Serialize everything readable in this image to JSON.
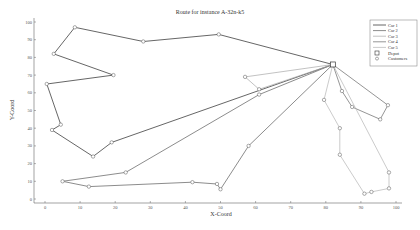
{
  "chart_data": {
    "type": "line",
    "title": "Route for instance A-32n-k5",
    "xlabel": "X-Coord",
    "ylabel": "Y-Coord",
    "xlim": [
      -3,
      102
    ],
    "ylim": [
      -3,
      102
    ],
    "xticks": [
      0,
      10,
      20,
      30,
      40,
      50,
      60,
      70,
      80,
      90,
      100
    ],
    "yticks": [
      0,
      10,
      20,
      30,
      40,
      50,
      60,
      70,
      80,
      90,
      100
    ],
    "grid": false,
    "legend_position": "upper right",
    "depot": {
      "x": 82,
      "y": 76
    },
    "series": [
      {
        "name": "Car 1",
        "color": "#555555",
        "width": 0.9,
        "points": [
          [
            82,
            76
          ],
          [
            49.5,
            93
          ],
          [
            28,
            89
          ],
          [
            8.5,
            97
          ],
          [
            2.5,
            82
          ],
          [
            19.5,
            70
          ],
          [
            0.5,
            65
          ],
          [
            4.5,
            42
          ],
          [
            2,
            39
          ],
          [
            13.7,
            24
          ],
          [
            19,
            32
          ],
          [
            82,
            76
          ]
        ]
      },
      {
        "name": "Car 2",
        "color": "#6e6e6e",
        "width": 0.8,
        "points": [
          [
            82,
            76
          ],
          [
            61,
            59
          ],
          [
            23,
            15
          ],
          [
            5,
            10
          ],
          [
            12.5,
            7
          ],
          [
            42,
            9.5
          ],
          [
            49,
            8.5
          ],
          [
            50,
            5.5
          ],
          [
            58,
            30
          ],
          [
            82,
            76
          ]
        ]
      },
      {
        "name": "Car 3",
        "color": "#a8a8a8",
        "width": 0.7,
        "points": [
          [
            82,
            76
          ],
          [
            57,
            69
          ],
          [
            61,
            62
          ],
          [
            82,
            76
          ]
        ]
      },
      {
        "name": "Car 4",
        "color": "#7a7a7a",
        "width": 0.8,
        "points": [
          [
            82,
            76
          ],
          [
            84.6,
            61
          ],
          [
            87.5,
            52
          ],
          [
            95.5,
            45
          ],
          [
            97.7,
            53
          ],
          [
            82,
            76
          ]
        ]
      },
      {
        "name": "Car 5",
        "color": "#b5b5b5",
        "width": 0.7,
        "points": [
          [
            82,
            76
          ],
          [
            79.5,
            56
          ],
          [
            84,
            40
          ],
          [
            84,
            25
          ],
          [
            91,
            3
          ],
          [
            93,
            4
          ],
          [
            98,
            6
          ],
          [
            98,
            15
          ],
          [
            82,
            76
          ]
        ]
      }
    ],
    "legend": [
      "Car 1",
      "Car 2",
      "Car 3",
      "Car 4",
      "Car 5",
      "Depot",
      "Customers"
    ]
  },
  "labels": {
    "title": "Route for instance A-32n-k5",
    "xlabel": "X-Coord",
    "ylabel": "Y-Coord",
    "legend_depot": "Depot",
    "legend_customers": "Customers"
  }
}
